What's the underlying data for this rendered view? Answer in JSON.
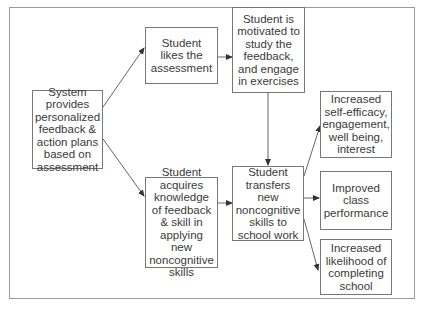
{
  "diagram": {
    "type": "flowchart",
    "nodes": {
      "system": {
        "label": "System provides personalized feedback & action plans based on assessment"
      },
      "likes": {
        "label": "Student likes the assessment"
      },
      "motivated": {
        "label": "Student is motivated to study the feedback, and engage in exercises"
      },
      "acquires": {
        "label": "Student acquires knowledge of feedback & skill in applying new noncognitive skills"
      },
      "transfers": {
        "label": "Student transfers new noncognitive skills to school work"
      },
      "efficacy": {
        "label": "Increased self-efficacy, engagement, well being, interest"
      },
      "performance": {
        "label": "Improved class performance"
      },
      "completing": {
        "label": "Increased likelihood of completing school"
      }
    },
    "edges": [
      {
        "from": "system",
        "to": "likes"
      },
      {
        "from": "system",
        "to": "acquires"
      },
      {
        "from": "likes",
        "to": "motivated"
      },
      {
        "from": "acquires",
        "to": "transfers"
      },
      {
        "from": "motivated",
        "to": "transfers"
      },
      {
        "from": "transfers",
        "to": "efficacy"
      },
      {
        "from": "transfers",
        "to": "performance"
      },
      {
        "from": "transfers",
        "to": "completing"
      }
    ],
    "colors": {
      "border": "#777777",
      "frame": "#9a9a9a",
      "arrow": "#555555",
      "text": "#3a3a3a"
    }
  }
}
